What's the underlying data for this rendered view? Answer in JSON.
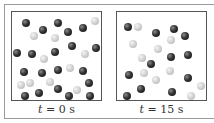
{
  "panels": [
    {
      "label_var": "t",
      "label_value": "= 0 s",
      "particles": [
        {
          "x": 6,
          "y": 3,
          "c": "dark"
        },
        {
          "x": 23,
          "y": 10,
          "c": "dark"
        },
        {
          "x": 14,
          "y": 16,
          "c": "light"
        },
        {
          "x": 38,
          "y": 3,
          "c": "dark"
        },
        {
          "x": 48,
          "y": 12,
          "c": "dark"
        },
        {
          "x": 35,
          "y": 18,
          "c": "light"
        },
        {
          "x": 63,
          "y": 8,
          "c": "dark"
        },
        {
          "x": 75,
          "y": 1,
          "c": "light"
        },
        {
          "x": -3,
          "y": 33,
          "c": "dark"
        },
        {
          "x": 12,
          "y": 34,
          "c": "dark"
        },
        {
          "x": 24,
          "y": 39,
          "c": "light"
        },
        {
          "x": 35,
          "y": 32,
          "c": "dark"
        },
        {
          "x": 52,
          "y": 26,
          "c": "dark"
        },
        {
          "x": 65,
          "y": 34,
          "c": "light"
        },
        {
          "x": 77,
          "y": 28,
          "c": "dark"
        },
        {
          "x": 4,
          "y": 52,
          "c": "dark"
        },
        {
          "x": 22,
          "y": 53,
          "c": "dark"
        },
        {
          "x": 38,
          "y": 50,
          "c": "dark"
        },
        {
          "x": 50,
          "y": 48,
          "c": "light"
        },
        {
          "x": 63,
          "y": 51,
          "c": "dark"
        },
        {
          "x": 1,
          "y": 65,
          "c": "light"
        },
        {
          "x": 10,
          "y": 63,
          "c": "light"
        },
        {
          "x": 30,
          "y": 62,
          "c": "light"
        },
        {
          "x": 69,
          "y": 63,
          "c": "dark"
        },
        {
          "x": 38,
          "y": 69,
          "c": "dark"
        },
        {
          "x": 57,
          "y": 70,
          "c": "light"
        },
        {
          "x": 19,
          "y": 73,
          "c": "dark"
        },
        {
          "x": 5,
          "y": 79,
          "c": "dark"
        },
        {
          "x": 49,
          "y": 78,
          "c": "dark"
        },
        {
          "x": 70,
          "y": 77,
          "c": "dark"
        }
      ]
    },
    {
      "label_var": "t",
      "label_value": "= 15 s",
      "particles": [
        {
          "x": 11,
          "y": 15,
          "c": "dark"
        },
        {
          "x": 21,
          "y": 15,
          "c": "light"
        },
        {
          "x": 39,
          "y": 21,
          "c": "dark"
        },
        {
          "x": 57,
          "y": 17,
          "c": "dark"
        },
        {
          "x": 54,
          "y": 28,
          "c": "light"
        },
        {
          "x": 68,
          "y": 24,
          "c": "dark"
        },
        {
          "x": 16,
          "y": 32,
          "c": "light"
        },
        {
          "x": 41,
          "y": 37,
          "c": "light"
        },
        {
          "x": 25,
          "y": 46,
          "c": "light"
        },
        {
          "x": 54,
          "y": 45,
          "c": "dark"
        },
        {
          "x": 71,
          "y": 43,
          "c": "dark"
        },
        {
          "x": 34,
          "y": 52,
          "c": "dark"
        },
        {
          "x": 12,
          "y": 63,
          "c": "dark"
        },
        {
          "x": 27,
          "y": 61,
          "c": "light"
        },
        {
          "x": 53,
          "y": 59,
          "c": "light"
        },
        {
          "x": 71,
          "y": 66,
          "c": "dark"
        },
        {
          "x": 39,
          "y": 68,
          "c": "light"
        },
        {
          "x": 24,
          "y": 77,
          "c": "dark"
        },
        {
          "x": 55,
          "y": 80,
          "c": "dark"
        },
        {
          "x": 84,
          "y": 74,
          "c": "light"
        },
        {
          "x": 10,
          "y": 86,
          "c": "dark"
        },
        {
          "x": 74,
          "y": 89,
          "c": "light"
        }
      ]
    }
  ]
}
